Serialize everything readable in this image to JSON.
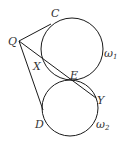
{
  "diagram": {
    "type": "geometry",
    "circles": [
      {
        "name": "ω1",
        "cx": 72,
        "cy": 49,
        "r": 31
      },
      {
        "name": "ω2",
        "cx": 70,
        "cy": 108,
        "r": 28
      }
    ],
    "points": {
      "Q": {
        "x": 19,
        "y": 41,
        "label": "Q"
      },
      "C": {
        "x": 51,
        "y": 24,
        "label": "C"
      },
      "X": {
        "x": 43,
        "y": 62,
        "label": "X"
      },
      "E": {
        "x": 71,
        "y": 79,
        "label": "E"
      },
      "Y": {
        "x": 96,
        "y": 98,
        "label": "Y"
      },
      "D": {
        "x": 43,
        "y": 110,
        "label": "D"
      }
    },
    "segments": [
      [
        "Q",
        "C"
      ],
      [
        "Q",
        "Y"
      ],
      [
        "Q",
        "D"
      ]
    ],
    "labels": {
      "C": "C",
      "Q": "Q",
      "X": "X",
      "E": "E",
      "Y": "Y",
      "D": "D",
      "omega1_base": "ω",
      "omega1_sub": "1",
      "omega2_base": "ω",
      "omega2_sub": "2"
    },
    "stroke_color": "#1a1a1a"
  }
}
